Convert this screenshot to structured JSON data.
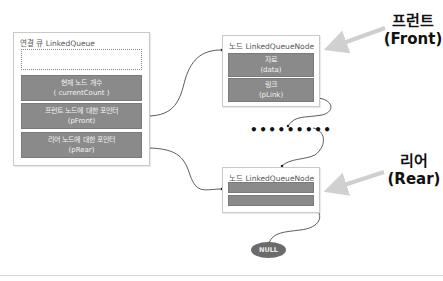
{
  "linked_queue": {
    "title": "연결 큐 LinkedQueue",
    "fields": [
      {
        "line1": "현재 노드 개수",
        "line2": "( currentCount )"
      },
      {
        "line1": "프런트 노드에 대한 포인터",
        "line2": "(pFront)"
      },
      {
        "line1": "리어 노드에 대한 포인터",
        "line2": "(pRear)"
      }
    ]
  },
  "front_node": {
    "title": "노드 LinkedQueueNode",
    "fields": [
      {
        "line1": "자료",
        "line2": "(data)"
      },
      {
        "line1": "링크",
        "line2": "(pLink)"
      }
    ]
  },
  "rear_node": {
    "title": "노드 LinkedQueueNode"
  },
  "ellipsis": "•••••••••",
  "null_label": "NULL",
  "labels": {
    "front_ko": "프런트",
    "front_en": "(Front)",
    "rear_ko": "리어",
    "rear_en": "(Rear)"
  },
  "colors": {
    "field_fill": "#8a8a8a",
    "border": "#c9c9c9",
    "pointer_arrow": "#cccccc",
    "null_fill": "#6b6b6b"
  }
}
